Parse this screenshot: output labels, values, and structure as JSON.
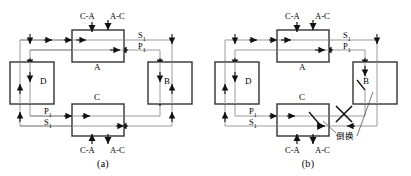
{
  "figure": {
    "panels": [
      {
        "caption": "(a)",
        "nodes": [
          {
            "id": "A",
            "label": "A"
          },
          {
            "id": "B",
            "label": "B"
          },
          {
            "id": "C",
            "label": "C"
          },
          {
            "id": "D",
            "label": "D"
          }
        ],
        "signal_labels": {
          "service_top": "S",
          "service_top_sub": "1",
          "protection_top": "P",
          "protection_top_sub": "1",
          "protection_bottom": "P",
          "protection_bottom_sub": "1",
          "service_bottom": "S",
          "service_bottom_sub": "1"
        },
        "tributary_labels": {
          "top_in": "C-A",
          "top_out": "A-C",
          "bottom_in": "C-A",
          "bottom_out": "A-C"
        },
        "fault": null,
        "annotation": null
      },
      {
        "caption": "(b)",
        "nodes": [
          {
            "id": "A",
            "label": "A"
          },
          {
            "id": "B",
            "label": "B"
          },
          {
            "id": "C",
            "label": "C"
          },
          {
            "id": "D",
            "label": "D"
          }
        ],
        "signal_labels": {
          "service_top": "S",
          "service_top_sub": "1",
          "protection_top": "P",
          "protection_top_sub": "1",
          "protection_bottom": "P",
          "protection_bottom_sub": "1",
          "service_bottom": "S",
          "service_bottom_sub": "1"
        },
        "tributary_labels": {
          "top_in": "C-A",
          "top_out": "A-C",
          "bottom_in": "C-A",
          "bottom_out": "A-C"
        },
        "fault": {
          "mark": "X"
        },
        "annotation": {
          "text": "倒换"
        }
      }
    ]
  },
  "colors": {
    "line": "#9a9a9a",
    "box_stroke": "#333333",
    "arrow": "#111111",
    "text": "#000000",
    "background": "#ffffff"
  }
}
